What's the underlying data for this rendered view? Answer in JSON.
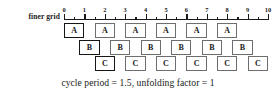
{
  "figure": {
    "row_label": "finer grid",
    "caption": "cycle period = 1.5, unfolding factor = 1"
  },
  "axis": {
    "min": 0,
    "max": 10,
    "major_step": 1,
    "minor_step": 0.5,
    "tick_labels": [
      "0",
      "1",
      "2",
      "3",
      "4",
      "5",
      "6",
      "7",
      "8",
      "9",
      "10"
    ]
  },
  "colors": {
    "line": "#1a1a1a",
    "box_border": "#6e6e6e",
    "box_border_highlight": "#161616",
    "box_fill": "#ffffff",
    "background": "#ffffff"
  },
  "chart_data": {
    "type": "table",
    "title": "cycle period = 1.5, unfolding factor = 1",
    "xlabel": "finer grid",
    "xlim": [
      0,
      10
    ],
    "grid": false,
    "cycle_period": 1.5,
    "unfolding_factor": 1,
    "rows": [
      {
        "name": "A",
        "row_index": 0,
        "duration": 1,
        "boxes": [
          {
            "label": "A",
            "start": 0,
            "end": 1,
            "highlight": true
          },
          {
            "label": "A",
            "start": 1.5,
            "end": 2.5,
            "highlight": false
          },
          {
            "label": "A",
            "start": 3,
            "end": 4,
            "highlight": false
          },
          {
            "label": "A",
            "start": 4.5,
            "end": 5.5,
            "highlight": false
          },
          {
            "label": "A",
            "start": 6,
            "end": 7,
            "highlight": false
          },
          {
            "label": "A",
            "start": 7.5,
            "end": 8.5,
            "highlight": false
          }
        ]
      },
      {
        "name": "B",
        "row_index": 1,
        "duration": 1,
        "boxes": [
          {
            "label": "B",
            "start": 0.75,
            "end": 1.75,
            "highlight": true
          },
          {
            "label": "B",
            "start": 2.25,
            "end": 3.25,
            "highlight": false
          },
          {
            "label": "B",
            "start": 3.75,
            "end": 4.75,
            "highlight": false
          },
          {
            "label": "B",
            "start": 5.25,
            "end": 6.25,
            "highlight": false
          },
          {
            "label": "B",
            "start": 6.75,
            "end": 7.75,
            "highlight": false
          },
          {
            "label": "B",
            "start": 8.25,
            "end": 9.25,
            "highlight": false
          }
        ]
      },
      {
        "name": "C",
        "row_index": 2,
        "duration": 1,
        "boxes": [
          {
            "label": "C",
            "start": 1.5,
            "end": 2.5,
            "highlight": true
          },
          {
            "label": "C",
            "start": 3,
            "end": 4,
            "highlight": false
          },
          {
            "label": "C",
            "start": 4.5,
            "end": 5.5,
            "highlight": false
          },
          {
            "label": "C",
            "start": 6,
            "end": 7,
            "highlight": false
          },
          {
            "label": "C",
            "start": 7.5,
            "end": 8.5,
            "highlight": false
          },
          {
            "label": "C",
            "start": 9,
            "end": 10,
            "highlight": false
          }
        ]
      }
    ]
  }
}
